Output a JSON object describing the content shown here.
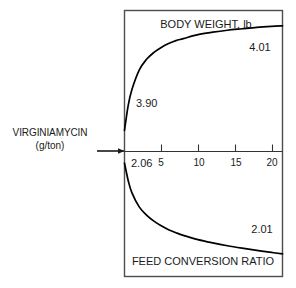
{
  "figure": {
    "input_label": {
      "name": "VIRGINIAMYCIN",
      "units": "(g/ton)"
    },
    "arrow_name": "input-arrow"
  },
  "chart_data": {
    "type": "line",
    "title": "",
    "panels": [
      {
        "id": "body-weight",
        "title": "BODY WEIGHT, lb",
        "ylabel": "BODY WEIGHT, lb",
        "xlabel": "VIRGINIAMYCIN (g/ton)",
        "start_label": "3.90",
        "end_label": "4.01",
        "start_value": 3.9,
        "end_value": 4.01,
        "ylim": [
          3.88,
          4.02
        ],
        "x": [
          0,
          0.5,
          1,
          2,
          3,
          4,
          5,
          6,
          7,
          8,
          10,
          12,
          14,
          16,
          18,
          20,
          21.5
        ],
        "y": [
          3.9,
          3.925,
          3.941,
          3.961,
          3.972,
          3.979,
          3.984,
          3.988,
          3.991,
          3.993,
          3.997,
          3.9995,
          4.0015,
          4.003,
          4.0045,
          4.0055,
          4.006
        ]
      },
      {
        "id": "feed-conversion",
        "title": "FEED CONVERSION RATIO",
        "ylabel": "FEED CONVERSION RATIO",
        "xlabel": "VIRGINIAMYCIN (g/ton)",
        "start_label": "2.06",
        "end_label": "2.01",
        "start_value": 2.06,
        "end_value": 2.01,
        "ylim": [
          2.005,
          2.065
        ],
        "x": [
          0,
          0.5,
          1,
          2,
          3,
          4,
          5,
          6,
          7,
          8,
          10,
          12,
          14,
          16,
          18,
          20,
          21.5
        ],
        "y": [
          2.06,
          2.0515,
          2.0455,
          2.0385,
          2.0345,
          2.0315,
          2.0292,
          2.0273,
          2.0258,
          2.0245,
          2.0224,
          2.0208,
          2.0194,
          2.0182,
          2.0171,
          2.0161,
          2.0154
        ]
      }
    ],
    "xlabel": "VIRGINIAMYCIN (g/ton)",
    "xlim": [
      0,
      21.5
    ],
    "xticks": [
      5,
      10,
      15,
      20
    ],
    "xtick_labels": [
      "5",
      "10",
      "15",
      "20"
    ],
    "grid": false,
    "legend": null,
    "axis_origin_label": "0",
    "colors": {
      "curve": "#000000",
      "frame": "#4d4d4d",
      "axis": "#333333",
      "text": "#1a1a1a"
    }
  }
}
